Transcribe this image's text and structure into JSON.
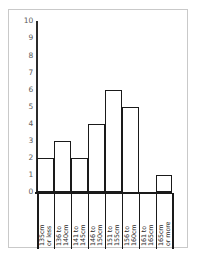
{
  "chart_data": {
    "type": "bar",
    "title": "",
    "subtitle": "",
    "xlabel": "",
    "ylabel": "",
    "categories": [
      "135cm\nor less",
      "136 to\n140cm",
      "141 to\n145cm",
      "146 to\n150cm",
      "151 to\n155cm",
      "156 to\n160cm",
      "161 to\n165cm",
      "165cm\nor more"
    ],
    "values": [
      2,
      3,
      2,
      4,
      6,
      5,
      0,
      1
    ],
    "ylim": [
      0,
      10
    ],
    "ytick_labels": [
      "10",
      "9",
      "8",
      "7",
      "6",
      "5",
      "4",
      "3",
      "2",
      "1",
      "0"
    ],
    "ytick_values": [
      10,
      9,
      8,
      7,
      6,
      5,
      4,
      3,
      2,
      1,
      0
    ],
    "grid": false,
    "legend": null,
    "bar_fill_color": "#ffffff",
    "bar_edge_color": "#1a1a1a",
    "axis_color": "#1a1a1a",
    "tick_label_color": "#5a5a5a",
    "frame_color": "#c9c9c9",
    "background_color": "#ffffff"
  }
}
